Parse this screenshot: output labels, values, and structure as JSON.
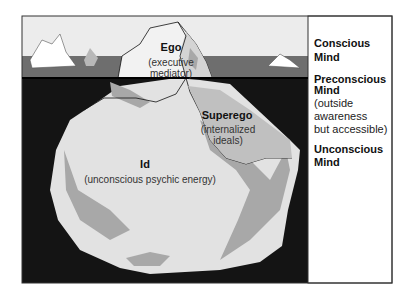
{
  "diagram": {
    "type": "iceberg",
    "colors": {
      "sky": "#ececec",
      "sea_surface": "#6e6e6e",
      "deep_water": "#141414",
      "ice_light": "#e2e2e2",
      "ice_shade": "#a8a8a8",
      "outline": "#111111",
      "panel_bg": "#ffffff"
    },
    "regions": {
      "ego": {
        "title": "Ego",
        "subtitle_line1": "(executive",
        "subtitle_line2": "mediator)"
      },
      "superego": {
        "title": "Superego",
        "subtitle_line1": "(internalized",
        "subtitle_line2": "ideals)"
      },
      "id": {
        "title": "Id",
        "subtitle": "(unconscious psychic energy)"
      }
    },
    "levels": [
      {
        "title_line1": "Conscious",
        "title_line2": "Mind"
      },
      {
        "title_line1": "Preconscious",
        "title_line2": "Mind",
        "desc_line1": "(outside",
        "desc_line2": "awareness",
        "desc_line3": "but accessible)"
      },
      {
        "title_line1": "Unconscious",
        "title_line2": "Mind"
      }
    ]
  }
}
